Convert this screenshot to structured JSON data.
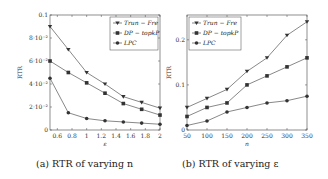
{
  "chart_data": [
    {
      "type": "line",
      "caption": "(a) RTR of varying n",
      "title": "",
      "xlabel": "ε",
      "ylabel": "RTR",
      "xlim": [
        0.5,
        2
      ],
      "ylim": [
        0,
        0.1
      ],
      "x_ticks": [
        "0.6",
        "0.8",
        "1",
        "1.2",
        "1.4",
        "1.6",
        "1.8",
        "2"
      ],
      "y_ticks": [
        "0",
        "2·10⁻²",
        "4·10⁻²",
        "6·10⁻²",
        "8·10⁻²",
        "0.1"
      ],
      "grid": false,
      "legend_position": "upper right",
      "x": [
        0.5,
        0.75,
        1.0,
        1.25,
        1.5,
        1.75,
        2.0
      ],
      "series": [
        {
          "name": "Trun − Fre",
          "marker": "triangle-down",
          "values": [
            0.09,
            0.07,
            0.05,
            0.04,
            0.029,
            0.024,
            0.019
          ]
        },
        {
          "name": "DP − topkP",
          "marker": "square",
          "values": [
            0.06,
            0.05,
            0.041,
            0.032,
            0.023,
            0.018,
            0.013
          ]
        },
        {
          "name": "LPC",
          "marker": "circle",
          "values": [
            0.045,
            0.015,
            0.01,
            0.008,
            0.007,
            0.006,
            0.005
          ]
        }
      ]
    },
    {
      "type": "line",
      "caption": "(b) RTR of varying ε",
      "title": "",
      "xlabel": "n",
      "ylabel": "RTR",
      "xlim": [
        50,
        350
      ],
      "ylim": [
        0,
        0.255
      ],
      "x_ticks": [
        "50",
        "100",
        "150",
        "200",
        "250",
        "300",
        "350"
      ],
      "y_ticks": [
        "0",
        "0.1",
        "0.2"
      ],
      "grid": false,
      "legend_position": "upper left",
      "x": [
        50,
        100,
        150,
        200,
        250,
        300,
        350
      ],
      "series": [
        {
          "name": "Trun − Fre",
          "marker": "triangle-down",
          "values": [
            0.05,
            0.07,
            0.09,
            0.13,
            0.16,
            0.21,
            0.24
          ]
        },
        {
          "name": "DP − topkP",
          "marker": "square",
          "values": [
            0.03,
            0.05,
            0.06,
            0.1,
            0.12,
            0.14,
            0.16
          ]
        },
        {
          "name": "LPC",
          "marker": "circle",
          "values": [
            0.01,
            0.02,
            0.04,
            0.05,
            0.06,
            0.065,
            0.075
          ]
        }
      ]
    }
  ],
  "captions": {
    "a": "(a) RTR of varying n",
    "b": "(b) RTR of varying ε"
  },
  "colors": {
    "line": "#555555",
    "marker": "#333333",
    "axis": "#444444"
  }
}
